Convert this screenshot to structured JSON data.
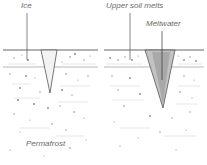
{
  "labels": {
    "ice": "Ice",
    "upper_soil_melts": "Upper soil melts",
    "meltwater": "Meltwater",
    "permafrost": "Permafrost"
  },
  "panels": [
    {
      "name": "ice-wedge-initial",
      "label": "Ice"
    },
    {
      "name": "ice-wedge-thaw",
      "label": "Upper soil melts"
    }
  ],
  "colors": {
    "line": "#555555",
    "wedge_fill_left": "#f3f3f3",
    "wedge_fill_right": "#b5b5b5",
    "label": "#6a6a6a",
    "speckle": "#8a8a8a"
  }
}
